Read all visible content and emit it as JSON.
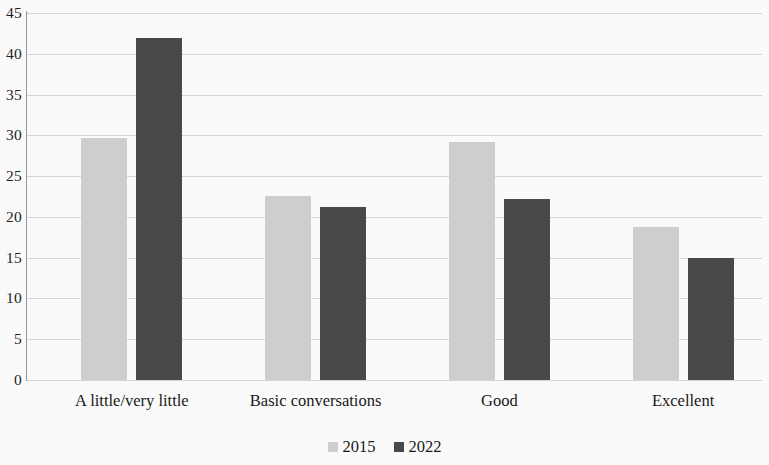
{
  "chart_data": {
    "type": "bar",
    "title": "",
    "subtitle": "",
    "xlabel": "",
    "ylabel": "",
    "categories": [
      "A little/very little",
      "Basic conversations",
      "Good",
      "Excellent"
    ],
    "series": [
      {
        "name": "2015",
        "color": "#d2d2d2",
        "values": [
          29.7,
          22.6,
          29.2,
          18.8
        ]
      },
      {
        "name": "2022",
        "color": "#4b4b4b",
        "values": [
          41.9,
          21.2,
          22.2,
          15.0
        ]
      }
    ],
    "ylim": [
      0,
      45
    ],
    "ytick_step": 5,
    "yticks": [
      "0",
      "5",
      "10",
      "15",
      "20",
      "25",
      "30",
      "35",
      "40",
      "45"
    ],
    "grid": "horizontal",
    "legend_position": "bottom",
    "annotations": []
  },
  "legend": {
    "entries": [
      {
        "label": "2015",
        "swatch": "light-gray-square"
      },
      {
        "label": "2022",
        "swatch": "dark-gray-square"
      }
    ]
  },
  "colors": {
    "series_2015": "#d2d2d2",
    "series_2022": "#4b4b4b",
    "gridline": "#d9d9d9",
    "axis": "#9a9a9a",
    "text": "#1a1a1a",
    "background": "#ffffff"
  }
}
